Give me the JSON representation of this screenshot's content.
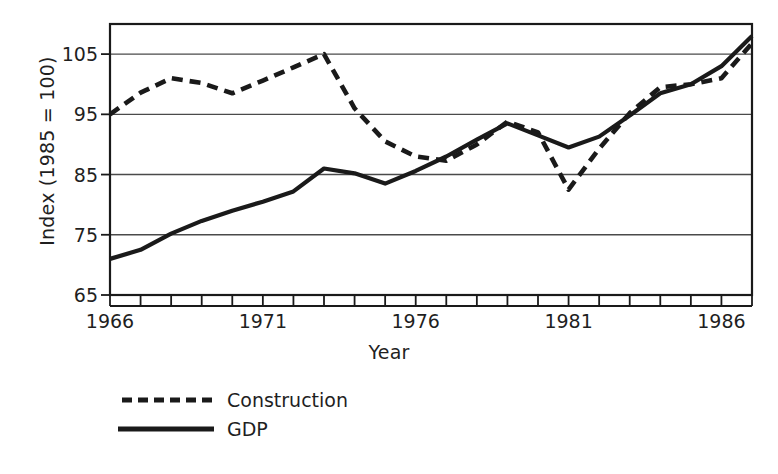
{
  "chart_data": {
    "type": "line",
    "title": "",
    "xlabel": "Year",
    "ylabel": "Index (1985 = 100)",
    "xlim": [
      1966,
      1987
    ],
    "ylim": [
      65,
      110
    ],
    "yticks": [
      65,
      75,
      85,
      95,
      105
    ],
    "xticks": [
      1966,
      1967,
      1968,
      1969,
      1970,
      1971,
      1972,
      1973,
      1974,
      1975,
      1976,
      1977,
      1978,
      1979,
      1980,
      1981,
      1982,
      1983,
      1984,
      1985,
      1986,
      1987
    ],
    "xtick_labels": [
      {
        "value": 1966,
        "label": "1966"
      },
      {
        "value": 1971,
        "label": "1971"
      },
      {
        "value": 1976,
        "label": "1976"
      },
      {
        "value": 1981,
        "label": "1981"
      },
      {
        "value": 1986,
        "label": "1986"
      }
    ],
    "grid": "horizontal",
    "legend_position": "below-left",
    "x": [
      1966,
      1967,
      1968,
      1969,
      1970,
      1971,
      1972,
      1973,
      1974,
      1975,
      1976,
      1977,
      1978,
      1979,
      1980,
      1981,
      1982,
      1983,
      1984,
      1985,
      1986,
      1987
    ],
    "series": [
      {
        "name": "Construction",
        "style": "dashed",
        "color": "#1a1a1a",
        "values": [
          95.0,
          98.6,
          101.0,
          100.2,
          98.5,
          100.6,
          102.8,
          105.0,
          96.0,
          90.5,
          88.0,
          87.3,
          90.0,
          93.8,
          92.0,
          82.5,
          89.3,
          95.2,
          99.5,
          100.0,
          101.0,
          106.8
        ]
      },
      {
        "name": "GDP",
        "style": "solid",
        "color": "#1a1a1a",
        "values": [
          71.0,
          72.5,
          75.2,
          77.3,
          79.0,
          80.5,
          82.2,
          86.0,
          85.2,
          83.5,
          85.6,
          88.0,
          90.8,
          93.5,
          91.5,
          89.5,
          91.3,
          94.8,
          98.5,
          100.0,
          103.0,
          108.0
        ]
      }
    ]
  },
  "legend": {
    "items": [
      {
        "label": "Construction",
        "style": "dashed"
      },
      {
        "label": "GDP",
        "style": "solid"
      }
    ]
  }
}
